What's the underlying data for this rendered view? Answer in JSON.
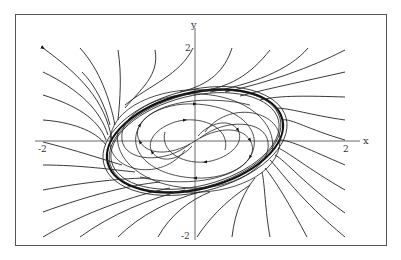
{
  "figure": {
    "type": "phase-portrait",
    "x_axis_label": "x",
    "y_axis_label": "y",
    "x_ticks": [
      "-2",
      "2"
    ],
    "y_ticks": [
      "2",
      "-2"
    ],
    "xlim": [
      -2,
      2
    ],
    "ylim": [
      -2,
      2
    ],
    "line_color": "#222222",
    "frame_color": "#555555"
  }
}
